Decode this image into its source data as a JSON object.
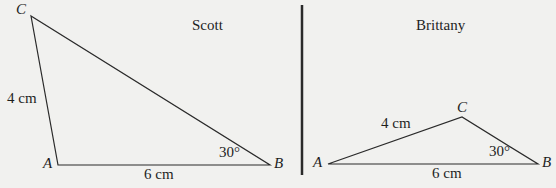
{
  "panels": [
    {
      "title": "Scott",
      "vertices": {
        "A": "A",
        "B": "B",
        "C": "C"
      },
      "side_AC": "4 cm",
      "side_AB": "6 cm",
      "angle_B": "30°"
    },
    {
      "title": "Brittany",
      "vertices": {
        "A": "A",
        "B": "B",
        "C": "C"
      },
      "side_AC": "4 cm",
      "side_AB": "6 cm",
      "angle_B": "30°"
    }
  ],
  "colors": {
    "line": "#2a2a2a",
    "background": "#f1f1ef"
  }
}
